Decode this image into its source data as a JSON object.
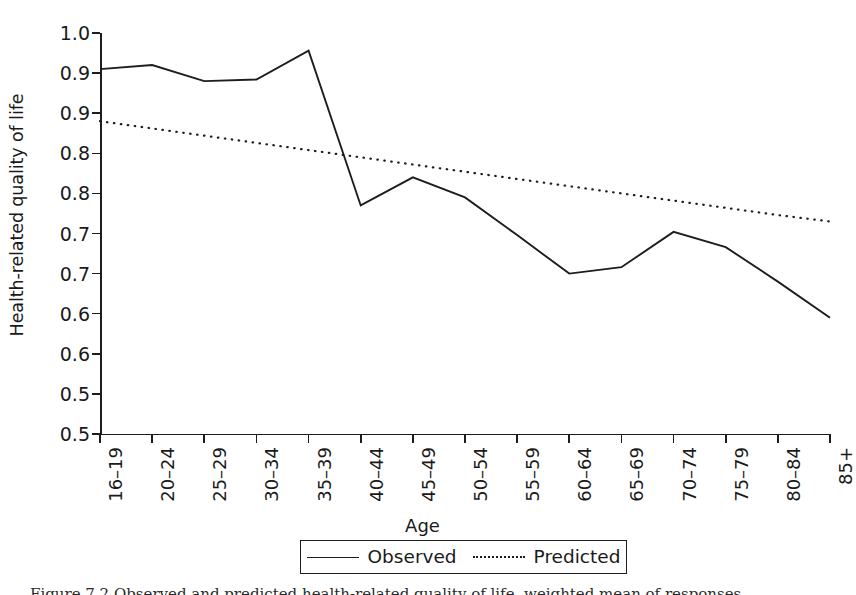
{
  "chart_data": {
    "type": "line",
    "title": "",
    "xlabel": "Age",
    "ylabel": "Health-related quality of life",
    "categories": [
      "16–19",
      "20–24",
      "25–29",
      "30–34",
      "35–39",
      "40–44",
      "45–49",
      "50–54",
      "55–59",
      "60–64",
      "65–69",
      "70–74",
      "75–79",
      "80–84",
      "85+"
    ],
    "ylim": [
      0.5,
      1.0
    ],
    "ytick_values": [
      1.0,
      0.95,
      0.9,
      0.85,
      0.8,
      0.75,
      0.7,
      0.65,
      0.6,
      0.55,
      0.5
    ],
    "ytick_labels": [
      "1.0",
      "0.9",
      "0.9",
      "0.8",
      "0.8",
      "0.7",
      "0.7",
      "0.6",
      "0.6",
      "0.5"
    ],
    "grid": false,
    "legend_position": "bottom-center",
    "series": [
      {
        "name": "Observed",
        "style": "solid",
        "color": "#1d1d1d",
        "values": [
          0.955,
          0.96,
          0.94,
          0.942,
          0.978,
          0.785,
          0.82,
          0.795,
          0.748,
          0.7,
          0.708,
          0.752,
          0.733,
          0.69,
          0.645
        ]
      },
      {
        "name": "Predicted",
        "style": "dotted",
        "color": "#1d1d1d",
        "values": [
          0.89,
          0.881,
          0.872,
          0.863,
          0.854,
          0.845,
          0.836,
          0.827,
          0.818,
          0.809,
          0.8,
          0.791,
          0.782,
          0.773,
          0.765
        ]
      }
    ]
  },
  "axis": {
    "y_title": "Health-related quality of life",
    "x_title": "Age"
  },
  "legend": {
    "items": [
      {
        "label": "Observed",
        "style": "solid"
      },
      {
        "label": "Predicted",
        "style": "dotted"
      }
    ]
  },
  "caption": {
    "figure_number": "Figure 7.2",
    "text": "Figure 7.2  Observed and predicted health-related quality of life, weighted mean of responses"
  }
}
